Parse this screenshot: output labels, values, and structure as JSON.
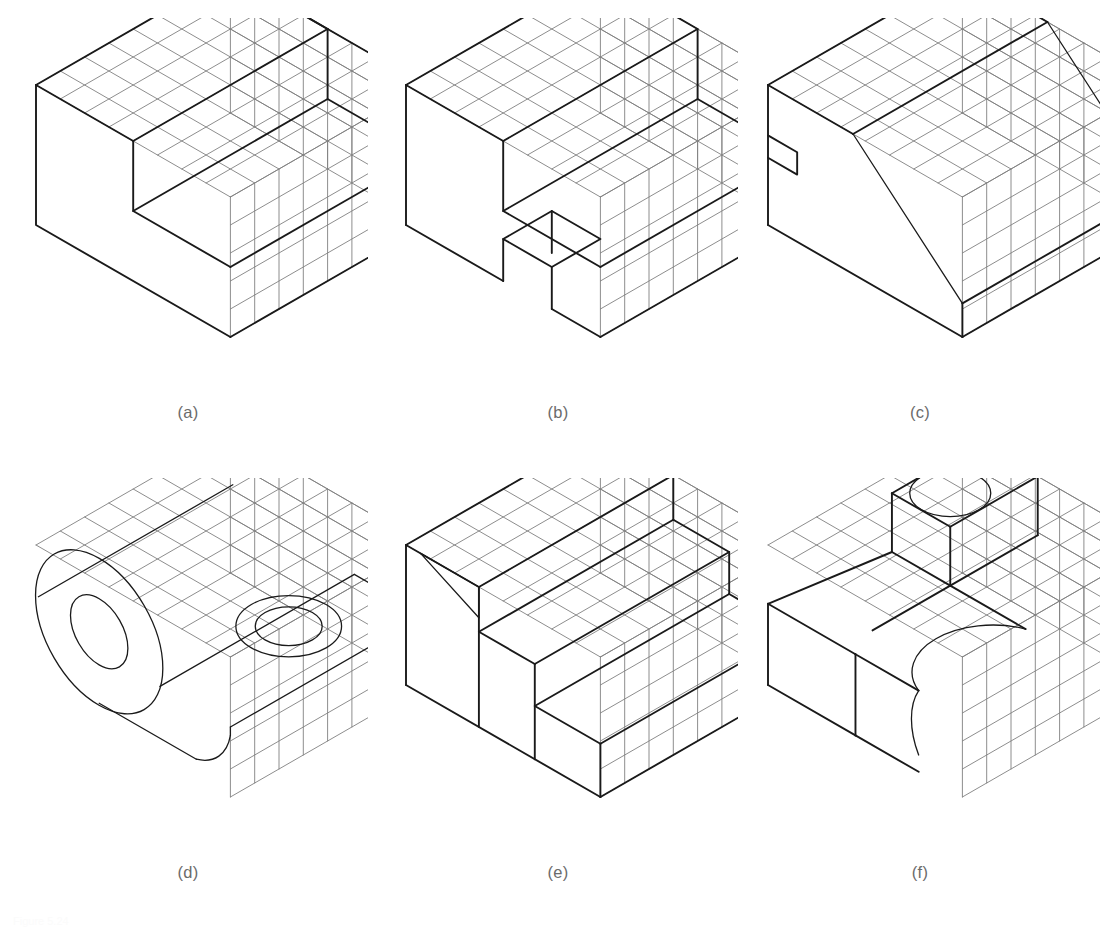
{
  "sheet": {
    "kind": "isometric-grid-sketching-exercises",
    "panel_count": 6,
    "footnote": "Figure 5.24"
  },
  "style": {
    "background": "#ffffff",
    "grid_color": "#808080",
    "object_color": "#1a1a1a",
    "caption_color": "#6b6b6b",
    "grid_stroke_width": 0.9,
    "object_stroke_width": 1.9,
    "curve_stroke_width": 1.3,
    "cell_width": 24.3,
    "cell_rise": 14.0
  },
  "panels": [
    {
      "id": "a",
      "caption": "(a)",
      "left": 8,
      "top": 18,
      "width": 360,
      "height": 420,
      "grid": {
        "cols": 8,
        "rows_v": 5,
        "origin_x": 28,
        "origin_y": 95
      },
      "description": "rectangular block with a rectangular step notch cut from the upper-left front region"
    },
    {
      "id": "b",
      "caption": "(b)",
      "left": 378,
      "top": 18,
      "width": 360,
      "height": 420,
      "grid": {
        "cols": 8,
        "rows_v": 5,
        "origin_x": 28,
        "origin_y": 95
      },
      "description": "block with a stepped shoulder and a small notch cut into the lower front face"
    },
    {
      "id": "c",
      "caption": "(c)",
      "left": 740,
      "top": 18,
      "width": 360,
      "height": 420,
      "grid": {
        "cols": 8,
        "rows_v": 5,
        "origin_x": 28,
        "origin_y": 95
      },
      "description": "wedge shaped block with an inclined top surface and a small slot on the left face"
    },
    {
      "id": "d",
      "caption": "(d)",
      "left": 8,
      "top": 478,
      "width": 360,
      "height": 420,
      "grid": {
        "cols": 8,
        "rows_v": 5,
        "origin_x": 28,
        "origin_y": 95
      },
      "description": "rounded-end bracket with a large boss, a through hole in the vertical face and a counterbored hole in the base"
    },
    {
      "id": "e",
      "caption": "(e)",
      "left": 378,
      "top": 478,
      "width": 360,
      "height": 420,
      "grid": {
        "cols": 8,
        "rows_v": 5,
        "origin_x": 28,
        "origin_y": 95
      },
      "description": "three level staircase block with an inclined chamfer at the top rear"
    },
    {
      "id": "f",
      "caption": "(f)",
      "left": 740,
      "top": 478,
      "width": 360,
      "height": 420,
      "grid": {
        "cols": 8,
        "rows_v": 5,
        "origin_x": 28,
        "origin_y": 95
      },
      "description": "L shaped base with a vertical post carrying a circular hole and a rounded slot end on the long arm"
    }
  ],
  "chart_data": {
    "type": "table",
    "categories": [
      "(a)",
      "(b)",
      "(c)",
      "(d)",
      "(e)",
      "(f)"
    ],
    "values": [
      1,
      1,
      1,
      1,
      1,
      1
    ]
  }
}
